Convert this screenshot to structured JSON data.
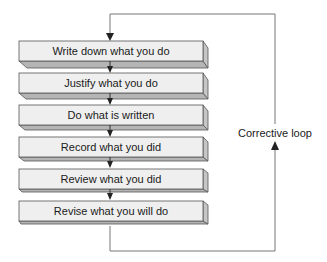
{
  "diagram": {
    "type": "process-flow-with-feedback-loop",
    "steps": [
      {
        "label": "Write down what you do"
      },
      {
        "label": "Justify what you do"
      },
      {
        "label": "Do what is written"
      },
      {
        "label": "Record what you did"
      },
      {
        "label": "Review what you did"
      },
      {
        "label": "Revise what you will do"
      }
    ],
    "loop": {
      "label": "Corrective loop",
      "direction": "from last step back to first step"
    },
    "colors": {
      "face": "#efefef",
      "bevel": "#b5b5b5",
      "side": "#c6c6c6",
      "border": "#555555",
      "line": "#666666",
      "text": "#1a1a1a"
    }
  }
}
